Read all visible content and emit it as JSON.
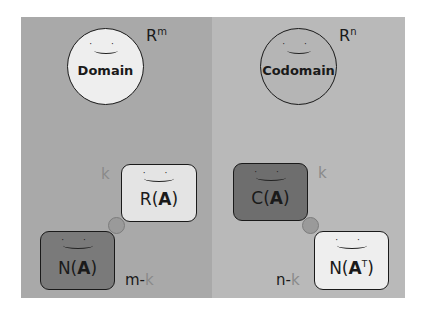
{
  "diagram": {
    "colors": {
      "left_panel": "#a9a9a9",
      "right_panel": "#b9b9b9",
      "domain_fill": "#eeeeee",
      "codomain_fill": "#b5b5b5",
      "row_space_fill": "#e4e4e4",
      "null_space_fill": "#7a7a7a",
      "column_space_fill": "#6e6e6e",
      "left_null_space_fill": "#eeeeee",
      "dim_k_color": "#8a8a8a",
      "dim_text_color": "#1a1a1a",
      "connector_fill": "#9a9a9a"
    },
    "domain": {
      "label": "Domain",
      "space_base": "R",
      "space_exp": "m",
      "face": "· ·"
    },
    "codomain": {
      "label": "Codomain",
      "space_base": "R",
      "space_exp": "n",
      "face": "· ·"
    },
    "row_space": {
      "prefix": "R(",
      "matrix": "A",
      "suffix": ")",
      "dimension": "k",
      "face": "· ·"
    },
    "null_space": {
      "prefix": "N(",
      "matrix": "A",
      "suffix": ")",
      "dimension_prefix": "m-",
      "dimension_k": "k",
      "face": "· ·"
    },
    "column_space": {
      "prefix": "C(",
      "matrix": "A",
      "suffix": ")",
      "dimension": "k",
      "face": "· ·"
    },
    "left_null_space": {
      "prefix": "N(",
      "matrix": "A",
      "exp": "T",
      "suffix": ")",
      "dimension_prefix": "n-",
      "dimension_k": "k",
      "face": "· ·"
    }
  }
}
